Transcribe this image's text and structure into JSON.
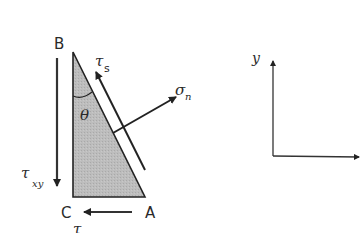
{
  "diagram": {
    "vertices": {
      "B": "B",
      "C": "C",
      "A": "A"
    },
    "angle_label": "θ",
    "forces": {
      "shear_along_plane": {
        "symbol": "τ",
        "subscript": "s"
      },
      "normal": {
        "symbol": "σ",
        "subscript": "n"
      },
      "shear_vertical_face": {
        "symbol": "τ",
        "subscript": "xy"
      },
      "shear_bottom_face": {
        "symbol": "τ",
        "subscript": ""
      }
    },
    "axes": {
      "y_label": "y",
      "x_label": ""
    },
    "colors": {
      "triangle_fill": "#b9b9b9",
      "stroke": "#222222",
      "background": "#ffffff"
    }
  }
}
